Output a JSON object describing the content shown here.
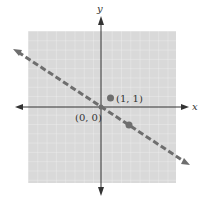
{
  "figure": {
    "type": "coordinate-plane",
    "axes": {
      "x_label": "x",
      "y_label": "y"
    },
    "grid": {
      "on": true,
      "range_units": [
        -8,
        8
      ],
      "background": "#d9d9d9",
      "line_color": "#f2f2f2"
    },
    "line": {
      "style": "dashed",
      "color": "#6e6e6e",
      "equation": "y = -2/3 x",
      "slope": -0.6667,
      "intercept": 0
    },
    "points": [
      {
        "label": "(0, 0)",
        "x": 0,
        "y": 0,
        "labeled": true
      },
      {
        "label": "(1, 1)",
        "x": 1,
        "y": 1,
        "labeled": true
      },
      {
        "label": "",
        "x": 3,
        "y": -2,
        "labeled": false
      }
    ],
    "point_color": "#6e6e6e"
  },
  "labels": {
    "x_axis": "x",
    "y_axis": "y",
    "origin": "(0, 0)",
    "point_1_1": "(1, 1)"
  }
}
